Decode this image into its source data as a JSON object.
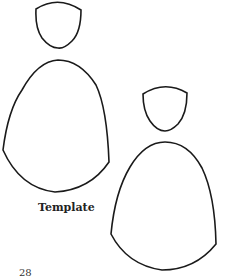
{
  "document": {
    "label": "Template",
    "page_number": "28"
  },
  "shapes": [
    {
      "name": "figure-1",
      "parts": [
        "head",
        "body"
      ]
    },
    {
      "name": "figure-2",
      "parts": [
        "head",
        "body"
      ]
    }
  ],
  "colors": {
    "stroke": "#1a1a1a",
    "background": "#ffffff"
  }
}
